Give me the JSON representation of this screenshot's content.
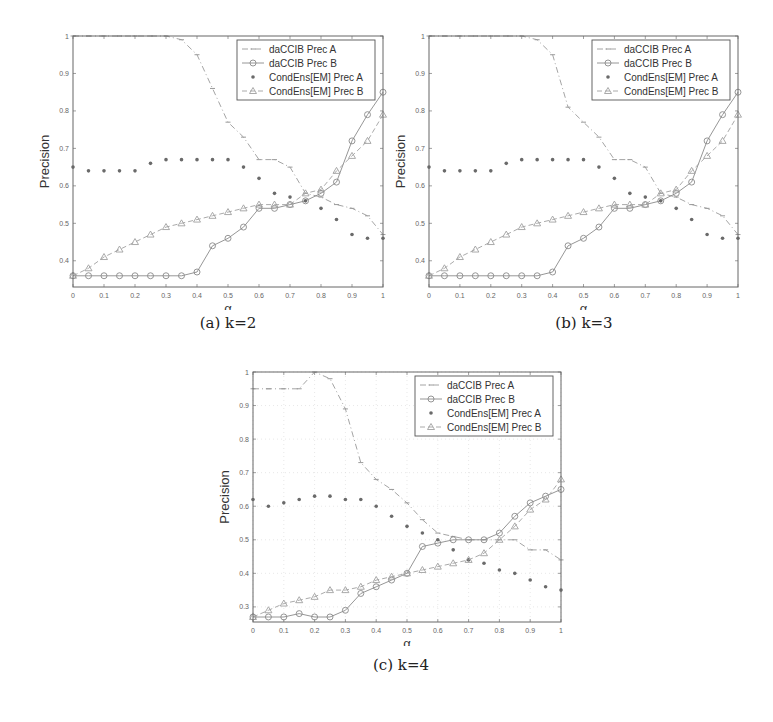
{
  "figure": {
    "captions": [
      "(a) k=2",
      "(b) k=3",
      "(c) k=4"
    ]
  },
  "chart_data": [
    {
      "type": "line",
      "title": "",
      "caption": "(a) k=2",
      "xlabel": "α",
      "ylabel": "Precision",
      "xlim": [
        0,
        1
      ],
      "ylim": [
        0.33,
        1.0
      ],
      "xticks": [
        "0",
        "0.1",
        "0.2",
        "0.3",
        "0.4",
        "0.5",
        "0.6",
        "0.7",
        "0.8",
        "0.9",
        "1"
      ],
      "yticks": [
        "0.4",
        "0.5",
        "0.6",
        "0.7",
        "0.8",
        "0.9",
        "1"
      ],
      "grid": false,
      "legend_position": "upper right",
      "x": [
        0,
        0.05,
        0.1,
        0.15,
        0.2,
        0.25,
        0.3,
        0.35,
        0.4,
        0.45,
        0.5,
        0.55,
        0.6,
        0.65,
        0.7,
        0.75,
        0.8,
        0.85,
        0.9,
        0.95,
        1.0
      ],
      "series": [
        {
          "name": "daCCIB  Prec A",
          "marker": "x",
          "line": "dashdot",
          "values": [
            1.0,
            1.0,
            1.0,
            1.0,
            1.0,
            1.0,
            1.0,
            0.99,
            0.95,
            0.86,
            0.77,
            0.73,
            0.67,
            0.67,
            0.65,
            0.58,
            0.57,
            0.55,
            0.54,
            0.52,
            0.47
          ]
        },
        {
          "name": "daCCIB  Prec B",
          "marker": "o",
          "line": "solid",
          "values": [
            0.36,
            0.36,
            0.36,
            0.36,
            0.36,
            0.36,
            0.36,
            0.36,
            0.37,
            0.44,
            0.46,
            0.49,
            0.54,
            0.54,
            0.55,
            0.56,
            0.58,
            0.61,
            0.72,
            0.79,
            0.85
          ]
        },
        {
          "name": "CondEns[EM]  Prec A",
          "marker": "*",
          "line": "none",
          "values": [
            0.65,
            0.64,
            0.64,
            0.64,
            0.64,
            0.66,
            0.67,
            0.67,
            0.67,
            0.67,
            0.67,
            0.65,
            0.62,
            0.58,
            0.57,
            0.56,
            0.54,
            0.51,
            0.47,
            0.46,
            0.46
          ]
        },
        {
          "name": "CondEns[EM]  Prec B",
          "marker": "^",
          "line": "dashed",
          "values": [
            0.36,
            0.38,
            0.41,
            0.43,
            0.45,
            0.47,
            0.49,
            0.5,
            0.51,
            0.52,
            0.53,
            0.54,
            0.55,
            0.55,
            0.55,
            0.58,
            0.59,
            0.64,
            0.68,
            0.72,
            0.79
          ]
        }
      ]
    },
    {
      "type": "line",
      "title": "",
      "caption": "(b) k=3",
      "xlabel": "α",
      "ylabel": "Precision",
      "xlim": [
        0,
        1
      ],
      "ylim": [
        0.33,
        1.0
      ],
      "xticks": [
        "0",
        "0.1",
        "0.2",
        "0.3",
        "0.4",
        "0.5",
        "0.6",
        "0.7",
        "0.8",
        "0.9",
        "1"
      ],
      "yticks": [
        "0.4",
        "0.5",
        "0.6",
        "0.7",
        "0.8",
        "0.9",
        "1"
      ],
      "grid": false,
      "legend_position": "upper right",
      "x": [
        0,
        0.05,
        0.1,
        0.15,
        0.2,
        0.25,
        0.3,
        0.35,
        0.4,
        0.45,
        0.5,
        0.55,
        0.6,
        0.65,
        0.7,
        0.75,
        0.8,
        0.85,
        0.9,
        0.95,
        1.0
      ],
      "series": [
        {
          "name": "daCCIB Prec A",
          "marker": "x",
          "line": "dashdot",
          "values": [
            1.0,
            1.0,
            1.0,
            1.0,
            1.0,
            1.0,
            1.0,
            0.99,
            0.95,
            0.81,
            0.77,
            0.73,
            0.67,
            0.67,
            0.65,
            0.58,
            0.57,
            0.55,
            0.54,
            0.52,
            0.47
          ]
        },
        {
          "name": "daCCIB Prec B",
          "marker": "o",
          "line": "solid",
          "values": [
            0.36,
            0.36,
            0.36,
            0.36,
            0.36,
            0.36,
            0.36,
            0.36,
            0.37,
            0.44,
            0.46,
            0.49,
            0.54,
            0.54,
            0.55,
            0.56,
            0.58,
            0.61,
            0.72,
            0.79,
            0.85
          ]
        },
        {
          "name": "CondEns[EM] Prec A",
          "marker": "*",
          "line": "none",
          "values": [
            0.65,
            0.64,
            0.64,
            0.64,
            0.64,
            0.66,
            0.67,
            0.67,
            0.67,
            0.67,
            0.67,
            0.65,
            0.62,
            0.58,
            0.57,
            0.56,
            0.54,
            0.51,
            0.47,
            0.46,
            0.46
          ]
        },
        {
          "name": "CondEns[EM] Prec B",
          "marker": "^",
          "line": "dashed",
          "values": [
            0.36,
            0.38,
            0.41,
            0.43,
            0.45,
            0.47,
            0.49,
            0.5,
            0.51,
            0.52,
            0.53,
            0.54,
            0.55,
            0.55,
            0.55,
            0.58,
            0.59,
            0.64,
            0.68,
            0.72,
            0.79
          ]
        }
      ]
    },
    {
      "type": "line",
      "title": "",
      "caption": "(c) k=4",
      "xlabel": "α",
      "ylabel": "Precision",
      "xlim": [
        0,
        1
      ],
      "ylim": [
        0.255,
        1.0
      ],
      "xticks": [
        "0",
        "0.1",
        "0.2",
        "0.3",
        "0.4",
        "0.5",
        "0.6",
        "0.7",
        "0.8",
        "0.9",
        "1"
      ],
      "yticks": [
        "0.3",
        "0.4",
        "0.5",
        "0.6",
        "0.7",
        "0.8",
        "0.9",
        "1"
      ],
      "grid": true,
      "legend_position": "upper right",
      "x": [
        0,
        0.05,
        0.1,
        0.15,
        0.2,
        0.25,
        0.3,
        0.35,
        0.4,
        0.45,
        0.5,
        0.55,
        0.6,
        0.65,
        0.7,
        0.75,
        0.8,
        0.85,
        0.9,
        0.95,
        1.0
      ],
      "series": [
        {
          "name": "daCCIB Prec A",
          "marker": "x",
          "line": "dashdot",
          "values": [
            0.95,
            0.95,
            0.95,
            0.95,
            1.0,
            0.98,
            0.89,
            0.73,
            0.68,
            0.65,
            0.61,
            0.56,
            0.52,
            0.51,
            0.5,
            0.5,
            0.5,
            0.5,
            0.47,
            0.47,
            0.44
          ]
        },
        {
          "name": "daCCIB Prec B",
          "marker": "o",
          "line": "solid",
          "values": [
            0.27,
            0.27,
            0.27,
            0.28,
            0.27,
            0.27,
            0.29,
            0.34,
            0.36,
            0.38,
            0.4,
            0.48,
            0.49,
            0.5,
            0.5,
            0.5,
            0.52,
            0.57,
            0.61,
            0.63,
            0.65
          ]
        },
        {
          "name": "CondEns[EM] Prec A",
          "marker": "*",
          "line": "none",
          "values": [
            0.62,
            0.6,
            0.61,
            0.62,
            0.63,
            0.63,
            0.62,
            0.62,
            0.6,
            0.57,
            0.54,
            0.52,
            0.5,
            0.47,
            0.44,
            0.43,
            0.41,
            0.4,
            0.38,
            0.36,
            0.35
          ]
        },
        {
          "name": "CondEns[EM] Prec B",
          "marker": "^",
          "line": "dashed",
          "values": [
            0.27,
            0.29,
            0.31,
            0.32,
            0.33,
            0.35,
            0.35,
            0.36,
            0.38,
            0.39,
            0.4,
            0.41,
            0.42,
            0.43,
            0.44,
            0.46,
            0.5,
            0.54,
            0.59,
            0.62,
            0.68
          ]
        }
      ]
    }
  ]
}
